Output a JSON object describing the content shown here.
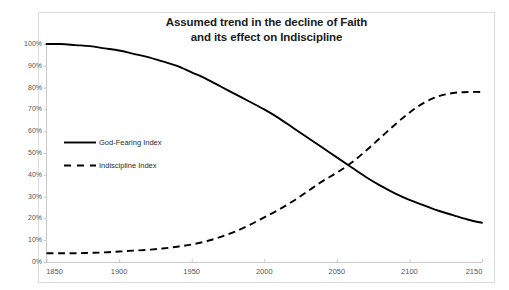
{
  "page": {
    "background_color": "#ffffff",
    "frame_border_color": "#dcdcdc"
  },
  "chart_data": {
    "type": "line",
    "title": "Assumed trend in the decline of Faith and its effect on Indiscipline",
    "title_lines": [
      "Assumed trend in the decline of Faith",
      "and its effect on Indiscipline"
    ],
    "xlabel": "",
    "ylabel": "",
    "xlim": [
      1850,
      2150
    ],
    "ylim": [
      0,
      100
    ],
    "grid": false,
    "legend_position": "inside-left",
    "x_tick_labels": [
      "1850",
      "1900",
      "1950",
      "2000",
      "2050",
      "2100",
      "2150"
    ],
    "x_ticks": [
      1850,
      1900,
      1950,
      2000,
      2050,
      2100,
      2150
    ],
    "y_tick_labels": [
      "0%",
      "10%",
      "20%",
      "30%",
      "40%",
      "50%",
      "60%",
      "70%",
      "80%",
      "90%",
      "100%"
    ],
    "y_ticks": [
      0,
      10,
      20,
      30,
      40,
      50,
      60,
      70,
      80,
      90,
      100
    ],
    "x": [
      1850,
      1860,
      1870,
      1880,
      1890,
      1900,
      1910,
      1920,
      1930,
      1940,
      1950,
      1960,
      1970,
      1980,
      1990,
      2000,
      2010,
      2020,
      2030,
      2040,
      2050,
      2060,
      2070,
      2080,
      2090,
      2100,
      2110,
      2120,
      2130,
      2140,
      2150
    ],
    "series": [
      {
        "name": "God-Fearing Index",
        "style": "solid",
        "color": "#000000",
        "values": [
          100,
          100,
          99.5,
          99,
          98,
          97,
          95.5,
          94,
          92,
          90,
          87,
          84,
          80.5,
          77,
          73.5,
          70,
          66,
          61.5,
          57,
          52.5,
          48,
          43.5,
          39,
          35,
          31.5,
          28.5,
          26,
          23.5,
          21.5,
          19.5,
          18
        ]
      },
      {
        "name": "Indiscipline Index",
        "style": "dashed",
        "color": "#000000",
        "values": [
          4,
          4,
          4,
          4.2,
          4.4,
          4.8,
          5.2,
          5.6,
          6.2,
          7,
          8,
          9.5,
          11.5,
          14,
          17,
          20.5,
          24,
          28,
          32.5,
          37,
          41,
          45.5,
          51,
          57,
          63,
          68.5,
          73,
          76,
          77.5,
          78,
          78
        ]
      }
    ],
    "crossover": {
      "x": 2060,
      "y": 43.5
    },
    "annotations": []
  },
  "legend": {
    "items": [
      {
        "label": "God-Fearing Index",
        "style": "solid"
      },
      {
        "label": "Indiscipline Index",
        "style": "dashed"
      }
    ]
  },
  "top_bleed": {
    "fragments": [
      "",
      "",
      ""
    ]
  }
}
